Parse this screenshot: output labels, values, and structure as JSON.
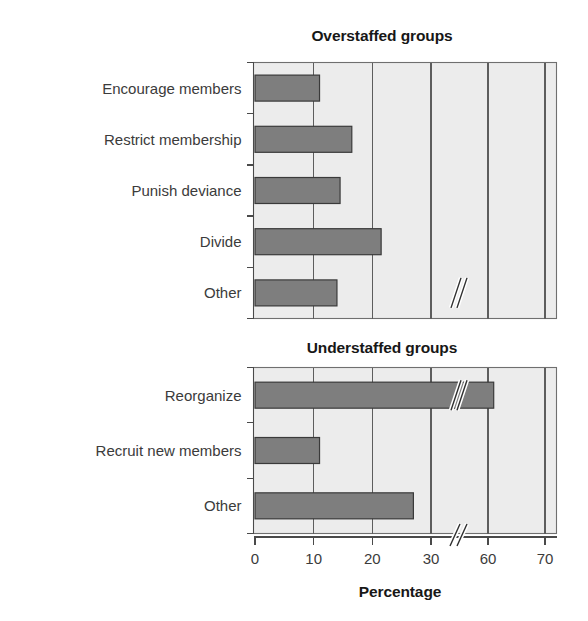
{
  "figure": {
    "axis_title": "Percentage",
    "background_color": "#ffffff",
    "plot_background_color": "#ececec",
    "bar_color": "#7e7e7e",
    "bar_edge_color": "#3a3a3a",
    "grid_color": "#5d5d5d"
  },
  "chart_data": [
    {
      "type": "bar",
      "orientation": "horizontal",
      "title": "Overstaffed groups",
      "categories": [
        "Encourage members",
        "Restrict membership",
        "Punish deviance",
        "Divide",
        "Other"
      ],
      "values": [
        11,
        16.5,
        14.5,
        21.5,
        33.5
      ],
      "xlabel": "Percentage",
      "ylabel": "",
      "xlim": [
        0,
        70
      ],
      "xticks": [
        0,
        10,
        20,
        30,
        60,
        70
      ],
      "xtick_labels": [
        "0",
        "10",
        "20",
        "30",
        "60",
        "70"
      ],
      "axis_break": {
        "between": [
          30,
          60
        ],
        "style": "double-slash"
      },
      "grid": true,
      "grid_axis": "x",
      "legend": "none"
    },
    {
      "type": "bar",
      "orientation": "horizontal",
      "title": "Understaffed groups",
      "categories": [
        "Reorganize",
        "Recruit new members",
        "Other"
      ],
      "values": [
        61,
        11,
        27
      ],
      "xlabel": "Percentage",
      "ylabel": "",
      "xlim": [
        0,
        70
      ],
      "xticks": [
        0,
        10,
        20,
        30,
        60,
        70
      ],
      "xtick_labels": [
        "0",
        "10",
        "20",
        "30",
        "60",
        "70"
      ],
      "axis_break": {
        "between": [
          30,
          60
        ],
        "style": "double-slash"
      },
      "grid": true,
      "grid_axis": "x",
      "legend": "none"
    }
  ]
}
